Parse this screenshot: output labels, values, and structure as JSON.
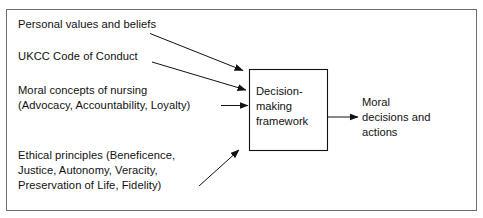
{
  "diagram": {
    "type": "flow-diagram",
    "background_color": "#ffffff",
    "frame_border_color": "#6e6e6e",
    "line_color": "#111111",
    "inputs": [
      {
        "id": "personal-values",
        "text": "Personal values and beliefs"
      },
      {
        "id": "ukcc-code",
        "text": "UKCC Code of Conduct"
      },
      {
        "id": "moral-concepts",
        "text": "Moral concepts of nursing\n(Advocacy, Accountability, Loyalty)"
      },
      {
        "id": "ethical-principles",
        "text": "Ethical principles (Beneficence,\nJustice, Autonomy, Veracity,\nPreservation of Life, Fidelity)"
      }
    ],
    "process_box": {
      "id": "decision-making-framework",
      "text": "Decision-\nmaking\nframework"
    },
    "output": {
      "id": "moral-decisions-and-actions",
      "text": "Moral\ndecisions and\nactions"
    },
    "connectors": [
      {
        "id": "arrow-personal-values-to-box",
        "direction": "down-right"
      },
      {
        "id": "arrow-ukcc-code-to-box",
        "direction": "down-right"
      },
      {
        "id": "arrow-moral-concepts-to-box",
        "direction": "right"
      },
      {
        "id": "arrow-ethical-principles-to-box",
        "direction": "up-right"
      },
      {
        "id": "arrow-box-to-output",
        "direction": "right"
      }
    ]
  }
}
